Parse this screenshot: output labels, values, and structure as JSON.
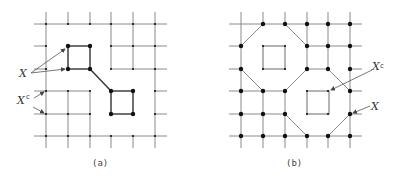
{
  "figure": {
    "panels": [
      {
        "id": "a",
        "caption": "(a)",
        "labels": {
          "X": "X",
          "Xc": "X",
          "Xc_sup": "c"
        }
      },
      {
        "id": "b",
        "caption": "(b)",
        "labels": {
          "X": "X",
          "Xc": "X",
          "Xc_sup": "c"
        }
      }
    ],
    "colors": {
      "line": "#8a8a8a",
      "dot": "#111111",
      "bold": "#333333"
    }
  }
}
